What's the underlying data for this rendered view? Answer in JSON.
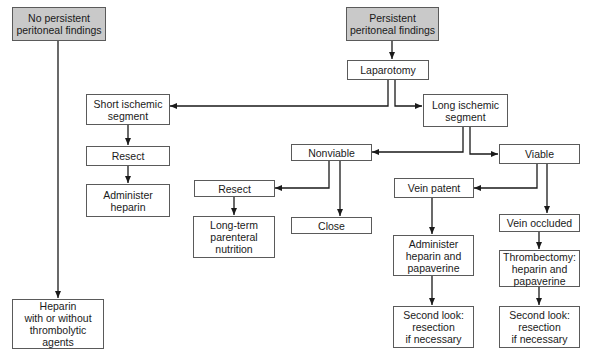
{
  "diagram": {
    "type": "flowchart",
    "nodes": {
      "no_persistent": {
        "lines": [
          "No persistent",
          "peritoneal findings"
        ],
        "shaded": true
      },
      "persistent": {
        "lines": [
          "Persistent",
          "peritoneal findings"
        ],
        "shaded": true
      },
      "laparotomy": {
        "lines": [
          "Laparotomy"
        ]
      },
      "short_segment": {
        "lines": [
          "Short ischemic",
          "segment"
        ]
      },
      "long_segment": {
        "lines": [
          "Long ischemic",
          "segment"
        ]
      },
      "resect_short": {
        "lines": [
          "Resect"
        ]
      },
      "administer_heparin": {
        "lines": [
          "Administer",
          "heparin"
        ]
      },
      "nonviable": {
        "lines": [
          "Nonviable"
        ]
      },
      "viable": {
        "lines": [
          "Viable"
        ]
      },
      "resect_nonviable": {
        "lines": [
          "Resect"
        ]
      },
      "close": {
        "lines": [
          "Close"
        ]
      },
      "long_term_nutrition": {
        "lines": [
          "Long-term",
          "parenteral",
          "nutrition"
        ]
      },
      "vein_patent": {
        "lines": [
          "Vein patent"
        ]
      },
      "vein_occluded": {
        "lines": [
          "Vein occluded"
        ]
      },
      "heparin_papaverine": {
        "lines": [
          "Administer",
          "heparin and",
          "papaverine"
        ]
      },
      "thrombectomy": {
        "lines": [
          "Thrombectomy:",
          "heparin and",
          "papaverine"
        ]
      },
      "second_look_patent": {
        "lines": [
          "Second look:",
          "resection",
          "if necessary"
        ]
      },
      "second_look_occluded": {
        "lines": [
          "Second look:",
          "resection",
          "if necessary"
        ]
      },
      "heparin_thrombolytic": {
        "lines": [
          "Heparin",
          "with or without",
          "thrombolytic",
          "agents"
        ]
      }
    },
    "edges": [
      [
        "no_persistent",
        "heparin_thrombolytic"
      ],
      [
        "persistent",
        "laparotomy"
      ],
      [
        "laparotomy",
        "short_segment"
      ],
      [
        "laparotomy",
        "long_segment"
      ],
      [
        "short_segment",
        "resect_short"
      ],
      [
        "resect_short",
        "administer_heparin"
      ],
      [
        "long_segment",
        "nonviable"
      ],
      [
        "long_segment",
        "viable"
      ],
      [
        "nonviable",
        "resect_nonviable"
      ],
      [
        "nonviable",
        "close"
      ],
      [
        "resect_nonviable",
        "long_term_nutrition"
      ],
      [
        "viable",
        "vein_patent"
      ],
      [
        "viable",
        "vein_occluded"
      ],
      [
        "vein_patent",
        "heparin_papaverine"
      ],
      [
        "heparin_papaverine",
        "second_look_patent"
      ],
      [
        "vein_occluded",
        "thrombectomy"
      ],
      [
        "thrombectomy",
        "second_look_occluded"
      ]
    ],
    "colors": {
      "shaded_fill": "#c9c9c9",
      "line": "#1a1a1a",
      "border": "#5a5a5a"
    }
  }
}
